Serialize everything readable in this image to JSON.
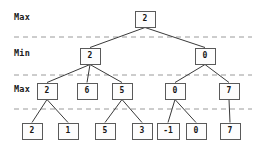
{
  "diagram": {
    "level_labels": [
      {
        "text": "Max",
        "x": 14,
        "y": 12
      },
      {
        "text": "Min",
        "x": 14,
        "y": 48
      },
      {
        "text": "Max",
        "x": 14,
        "y": 84
      }
    ],
    "separator_lines_y": [
      37,
      75,
      109
    ],
    "colors": {
      "node_border": "#5a5a5a",
      "node_fill": "#fdfdfd",
      "edge": "#3a3a3a",
      "separator": "#9a9a9a",
      "text": "#161616",
      "background": "#ffffff"
    },
    "node_size": {
      "w": 21,
      "h": 17
    },
    "nodes": [
      {
        "id": "root",
        "label": "2",
        "level": 0,
        "cx": 145,
        "cy": 19,
        "role": "Max"
      },
      {
        "id": "min-1",
        "label": "2",
        "level": 1,
        "cx": 90,
        "cy": 56,
        "role": "Min"
      },
      {
        "id": "min-2",
        "label": "0",
        "level": 1,
        "cx": 205,
        "cy": 56,
        "role": "Min"
      },
      {
        "id": "max-1",
        "label": "2",
        "level": 2,
        "cx": 47,
        "cy": 91,
        "role": "Max"
      },
      {
        "id": "max-2",
        "label": "6",
        "level": 2,
        "cx": 87,
        "cy": 91,
        "role": "Max"
      },
      {
        "id": "max-3",
        "label": "5",
        "level": 2,
        "cx": 122,
        "cy": 91,
        "role": "Max"
      },
      {
        "id": "max-4",
        "label": "0",
        "level": 2,
        "cx": 175,
        "cy": 91,
        "role": "Max"
      },
      {
        "id": "max-5",
        "label": "7",
        "level": 2,
        "cx": 229,
        "cy": 91,
        "role": "Max"
      },
      {
        "id": "leaf-1",
        "label": "2",
        "level": 3,
        "cx": 32,
        "cy": 131,
        "role": "Leaf"
      },
      {
        "id": "leaf-2",
        "label": "1",
        "level": 3,
        "cx": 68,
        "cy": 131,
        "role": "Leaf"
      },
      {
        "id": "leaf-3",
        "label": "5",
        "level": 3,
        "cx": 105,
        "cy": 131,
        "role": "Leaf"
      },
      {
        "id": "leaf-4",
        "label": "3",
        "level": 3,
        "cx": 142,
        "cy": 131,
        "role": "Leaf"
      },
      {
        "id": "leaf-5",
        "label": "-1",
        "level": 3,
        "cx": 168,
        "cy": 131,
        "role": "Leaf"
      },
      {
        "id": "leaf-6",
        "label": "0",
        "level": 3,
        "cx": 196,
        "cy": 131,
        "role": "Leaf"
      },
      {
        "id": "leaf-7",
        "label": "7",
        "level": 3,
        "cx": 230,
        "cy": 131,
        "role": "Leaf"
      }
    ],
    "edges": [
      {
        "from": "root",
        "to": "min-1"
      },
      {
        "from": "root",
        "to": "min-2"
      },
      {
        "from": "min-1",
        "to": "max-1"
      },
      {
        "from": "min-1",
        "to": "max-2"
      },
      {
        "from": "min-1",
        "to": "max-3"
      },
      {
        "from": "min-2",
        "to": "max-4"
      },
      {
        "from": "min-2",
        "to": "max-5"
      },
      {
        "from": "max-1",
        "to": "leaf-1"
      },
      {
        "from": "max-1",
        "to": "leaf-2"
      },
      {
        "from": "max-3",
        "to": "leaf-3"
      },
      {
        "from": "max-3",
        "to": "leaf-4"
      },
      {
        "from": "max-4",
        "to": "leaf-5"
      },
      {
        "from": "max-4",
        "to": "leaf-6"
      },
      {
        "from": "max-5",
        "to": "leaf-7"
      }
    ]
  }
}
